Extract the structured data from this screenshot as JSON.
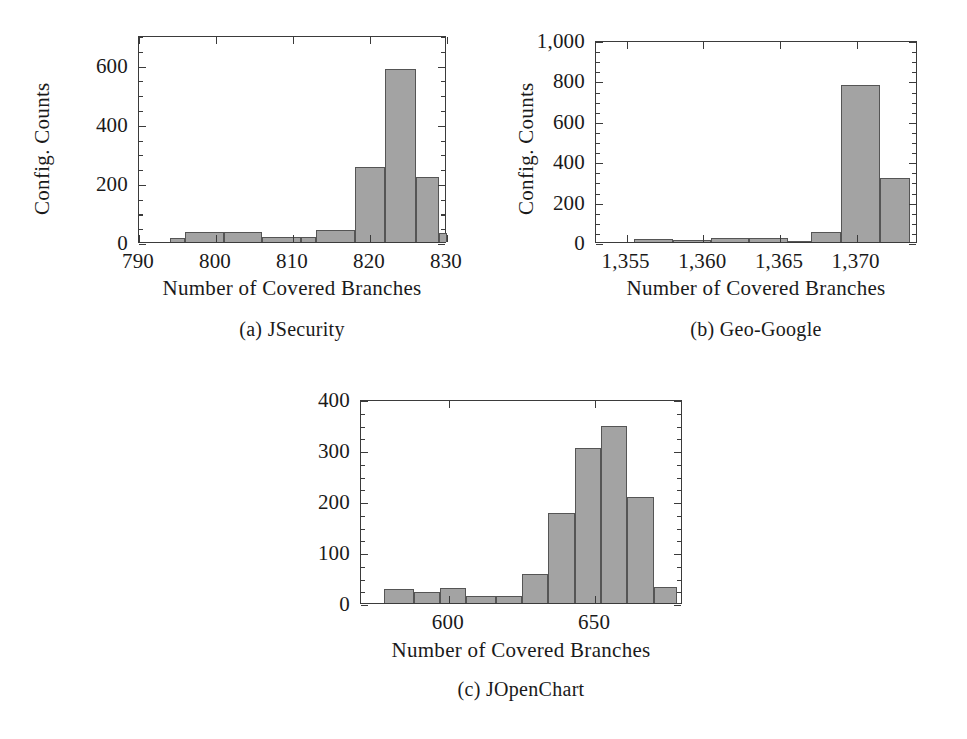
{
  "figure": {
    "kind": "multi-panel-histogram-figure",
    "panel_count": 3
  },
  "chart_data": [
    {
      "type": "bar",
      "id": "jsecurity",
      "title": "",
      "subcaption": "(a) JSecurity",
      "xlabel": "Number of Covered Branches",
      "ylabel": "Config. Counts",
      "xlim": [
        790,
        830
      ],
      "ylim": [
        0,
        700
      ],
      "xticks": [
        790,
        800,
        810,
        820,
        830
      ],
      "xtick_labels": [
        "790",
        "800",
        "810",
        "820",
        "830"
      ],
      "yticks": [
        0,
        200,
        400,
        600
      ],
      "ytick_labels": [
        "0",
        "200",
        "400",
        "600"
      ],
      "y_minor_step": 50,
      "grid": false,
      "legend": "none",
      "bin_edges": [
        791,
        794,
        796,
        801,
        806,
        811,
        813,
        818,
        822,
        826,
        829
      ],
      "bins": [
        {
          "x0": 791,
          "x1": 794,
          "value": 0
        },
        {
          "x0": 794,
          "x1": 796,
          "value": 15
        },
        {
          "x0": 796,
          "x1": 801,
          "value": 33
        },
        {
          "x0": 801,
          "x1": 806,
          "value": 33
        },
        {
          "x0": 806,
          "x1": 811,
          "value": 18
        },
        {
          "x0": 811,
          "x1": 813,
          "value": 18
        },
        {
          "x0": 813,
          "x1": 818,
          "value": 40
        },
        {
          "x0": 818,
          "x1": 822,
          "value": 255
        },
        {
          "x0": 822,
          "x1": 826,
          "value": 585
        },
        {
          "x0": 826,
          "x1": 829,
          "value": 220
        },
        {
          "x0": 829,
          "x1": 832,
          "value": 30
        }
      ]
    },
    {
      "type": "bar",
      "id": "geo-google",
      "title": "",
      "subcaption": "(b) Geo-Google",
      "xlabel": "Number of Covered Branches",
      "ylabel": "Config. Counts",
      "xlim": [
        1353,
        1374
      ],
      "ylim": [
        0,
        1000
      ],
      "xticks": [
        1355,
        1360,
        1365,
        1370
      ],
      "xtick_labels": [
        "1,355",
        "1,360",
        "1,365",
        "1,370"
      ],
      "yticks": [
        0,
        200,
        400,
        600,
        800,
        1000
      ],
      "ytick_labels": [
        "0",
        "200",
        "400",
        "600",
        "800",
        "1,000"
      ],
      "y_minor_step": 50,
      "grid": false,
      "legend": "none",
      "bins": [
        {
          "x0": 1353.0,
          "x1": 1355.5,
          "value": 0
        },
        {
          "x0": 1355.5,
          "x1": 1358.0,
          "value": 16
        },
        {
          "x0": 1358.0,
          "x1": 1360.5,
          "value": 12
        },
        {
          "x0": 1360.5,
          "x1": 1363.0,
          "value": 20
        },
        {
          "x0": 1363.0,
          "x1": 1365.5,
          "value": 18
        },
        {
          "x0": 1365.5,
          "x1": 1367.0,
          "value": 6
        },
        {
          "x0": 1367.0,
          "x1": 1369.0,
          "value": 48
        },
        {
          "x0": 1369.0,
          "x1": 1371.5,
          "value": 775
        },
        {
          "x0": 1371.5,
          "x1": 1373.5,
          "value": 315
        }
      ]
    },
    {
      "type": "bar",
      "id": "jopenchart",
      "title": "",
      "subcaption": "(c) JOpenChart",
      "xlabel": "Number of Covered Branches",
      "ylabel": "Config. Counts",
      "xlim": [
        570,
        680
      ],
      "ylim": [
        0,
        400
      ],
      "xticks": [
        600,
        650
      ],
      "xtick_labels": [
        "600",
        "650"
      ],
      "yticks": [
        0,
        100,
        200,
        300,
        400
      ],
      "ytick_labels": [
        "0",
        "100",
        "200",
        "300",
        "400"
      ],
      "y_minor_step": 25,
      "grid": false,
      "legend": "none",
      "bins": [
        {
          "x0": 570,
          "x1": 578,
          "value": 0
        },
        {
          "x0": 578,
          "x1": 588,
          "value": 27
        },
        {
          "x0": 588,
          "x1": 597,
          "value": 22
        },
        {
          "x0": 597,
          "x1": 606,
          "value": 29
        },
        {
          "x0": 606,
          "x1": 616,
          "value": 13
        },
        {
          "x0": 616,
          "x1": 625,
          "value": 13
        },
        {
          "x0": 625,
          "x1": 634,
          "value": 57
        },
        {
          "x0": 634,
          "x1": 643,
          "value": 177
        },
        {
          "x0": 643,
          "x1": 652,
          "value": 303
        },
        {
          "x0": 652,
          "x1": 661,
          "value": 348
        },
        {
          "x0": 661,
          "x1": 670,
          "value": 207
        },
        {
          "x0": 670,
          "x1": 678,
          "value": 31
        }
      ]
    }
  ],
  "style": {
    "bar_fill": "#a3a3a3",
    "bar_stroke": "#555555",
    "axis_color": "#3b3b3b",
    "text_color": "#1a1a1a",
    "background": "#ffffff"
  }
}
